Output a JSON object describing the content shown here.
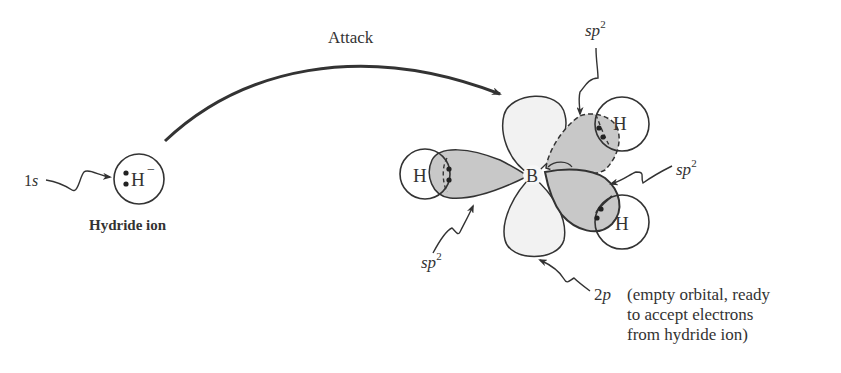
{
  "diagram": {
    "attack_label": "Attack",
    "hydride": {
      "atom": "H",
      "charge": "−",
      "name": "Hydride ion",
      "orbital_label_main": "1",
      "orbital_label_italic": "s"
    },
    "boron": {
      "atom": "B"
    },
    "hydrogens": [
      "H",
      "H",
      "H"
    ],
    "sp2_labels": [
      {
        "main": "sp",
        "sup": "2",
        "position": "top"
      },
      {
        "main": "sp",
        "sup": "2",
        "position": "right"
      },
      {
        "main": "sp",
        "sup": "2",
        "position": "bottom-left"
      }
    ],
    "p_orbital": {
      "label_num": "2",
      "label_italic": "p",
      "description_lines": [
        "(empty orbital, ready",
        "to accept electrons",
        "from hydride ion)"
      ]
    },
    "colors": {
      "line": "#333333",
      "sp2_fill": "#c8c8c8",
      "p_fill": "#f2f2f2",
      "background": "#ffffff"
    }
  }
}
